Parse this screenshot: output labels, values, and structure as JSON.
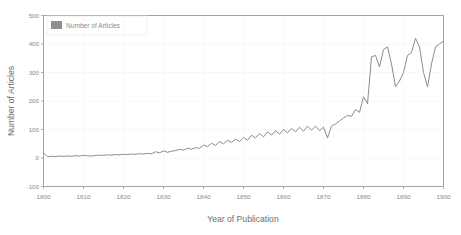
{
  "chart_data": {
    "type": "line",
    "title": "",
    "xlabel": "Year of Publication",
    "ylabel": "Number of Articles",
    "xlim": [
      1800,
      1900
    ],
    "ylim": [
      -100,
      500
    ],
    "xticks": [
      1800,
      1810,
      1820,
      1830,
      1840,
      1850,
      1860,
      1870,
      1880,
      1890,
      1900
    ],
    "xtick_labels": [
      "1800",
      "1810",
      "1820",
      "1830",
      "1840",
      "1850",
      "1860",
      "1870",
      "1880",
      "1890",
      "1900"
    ],
    "yticks": [
      -100,
      0,
      100,
      200,
      300,
      400,
      500
    ],
    "ytick_labels": [
      "-100",
      "0",
      "100",
      "200",
      "300",
      "400",
      "500"
    ],
    "grid": true,
    "grid_color": "#f6f6f6",
    "line_color": "#8c8c8c",
    "legend_position": "top-left",
    "legend": [
      "Number of Articles"
    ],
    "series": [
      {
        "name": "Number of Articles",
        "x": [
          1800,
          1801,
          1802,
          1803,
          1804,
          1805,
          1806,
          1807,
          1808,
          1809,
          1810,
          1811,
          1812,
          1813,
          1814,
          1815,
          1816,
          1817,
          1818,
          1819,
          1820,
          1821,
          1822,
          1823,
          1824,
          1825,
          1826,
          1827,
          1828,
          1829,
          1830,
          1831,
          1832,
          1833,
          1834,
          1835,
          1836,
          1837,
          1838,
          1839,
          1840,
          1841,
          1842,
          1843,
          1844,
          1845,
          1846,
          1847,
          1848,
          1849,
          1850,
          1851,
          1852,
          1853,
          1854,
          1855,
          1856,
          1857,
          1858,
          1859,
          1860,
          1861,
          1862,
          1863,
          1864,
          1865,
          1866,
          1867,
          1868,
          1869,
          1870,
          1871,
          1872,
          1873,
          1874,
          1875,
          1876,
          1877,
          1878,
          1879,
          1880,
          1881,
          1882,
          1883,
          1884,
          1885,
          1886,
          1887,
          1888,
          1889,
          1890,
          1891,
          1892,
          1893,
          1894,
          1895,
          1896,
          1897,
          1898,
          1899,
          1900
        ],
        "values": [
          18,
          5,
          6,
          5,
          7,
          6,
          7,
          6,
          8,
          7,
          9,
          8,
          7,
          9,
          10,
          9,
          11,
          10,
          12,
          11,
          13,
          12,
          14,
          13,
          15,
          14,
          16,
          15,
          22,
          18,
          25,
          20,
          24,
          26,
          30,
          28,
          34,
          31,
          36,
          34,
          45,
          40,
          52,
          44,
          58,
          50,
          62,
          55,
          66,
          58,
          72,
          62,
          80,
          70,
          86,
          74,
          92,
          80,
          96,
          84,
          100,
          88,
          104,
          92,
          108,
          94,
          112,
          98,
          112,
          96,
          108,
          70,
          112,
          120,
          130,
          140,
          150,
          146,
          170,
          160,
          215,
          190,
          355,
          360,
          320,
          380,
          390,
          330,
          250,
          270,
          300,
          360,
          370,
          420,
          390,
          300,
          250,
          330,
          390,
          400,
          410
        ]
      }
    ]
  },
  "watermark": {
    "text": ""
  }
}
